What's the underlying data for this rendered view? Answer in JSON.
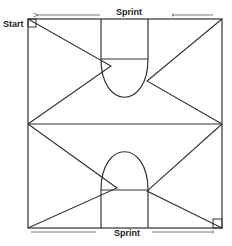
{
  "diagram": {
    "labels": {
      "start": "Start",
      "sprint_top": "Sprint",
      "sprint_bottom": "Sprint"
    },
    "colors": {
      "line": "#333333",
      "background": "#ffffff"
    },
    "court": {
      "left": 28,
      "top": 19,
      "right": 222,
      "bottom": 228,
      "midline_y": 124
    },
    "keys": [
      {
        "position": "top",
        "x1": 101,
        "x2": 148,
        "ft_line_y": 59,
        "arc_apex_y": 98
      },
      {
        "position": "bottom",
        "x1": 101,
        "x2": 148,
        "ft_line_y": 190,
        "arc_apex_y": 151
      }
    ],
    "path": [
      [
        28,
        19
      ],
      [
        111,
        66
      ],
      [
        28,
        124
      ],
      [
        147,
        81
      ],
      [
        222,
        19
      ],
      [
        222,
        124
      ],
      [
        147,
        191
      ],
      [
        222,
        228
      ],
      [
        28,
        228
      ],
      [
        117,
        188
      ],
      [
        28,
        124
      ],
      [
        222,
        124
      ]
    ],
    "markers": [
      "start-box-top-left",
      "finish-box-bottom-right"
    ]
  }
}
